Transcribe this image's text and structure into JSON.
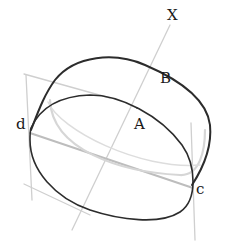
{
  "diagram": {
    "type": "pencil-sketch-cylinder",
    "labels": {
      "x": "X",
      "b": "B",
      "a": "A",
      "d": "d",
      "c": "c"
    },
    "colors": {
      "ink": "#2a2a2a",
      "construction": "#c8c8c8",
      "background": "#ffffff"
    }
  }
}
